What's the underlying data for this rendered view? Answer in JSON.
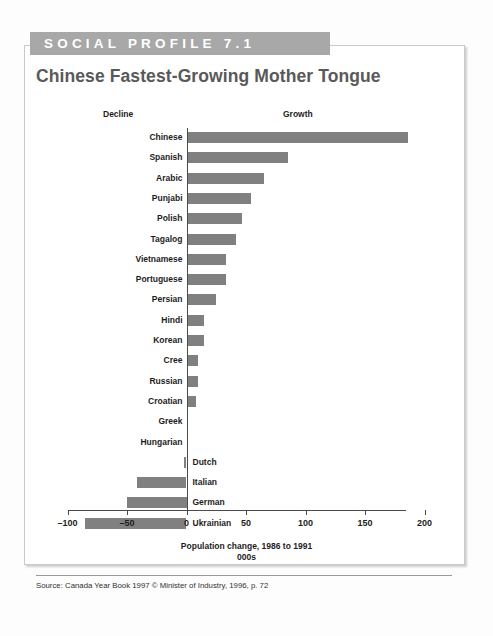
{
  "banner": {
    "label": "SOCIAL PROFILE 7.1"
  },
  "title": "Chinese Fastest-Growing Mother Tongue",
  "headers": {
    "decline": "Decline",
    "growth": "Growth"
  },
  "source": "Source: Canada Year Book 1997 © Minister of Industry, 1996, p. 72",
  "colors": {
    "banner_fill": "#a8a8a8",
    "bar_fill": "#808080",
    "title_text": "#595959",
    "axis": "#4a4a4a",
    "card_border": "#c9c9c9"
  },
  "chart_data": {
    "type": "bar",
    "orientation": "horizontal",
    "title": "Chinese Fastest-Growing Mother Tongue",
    "xlabel": "Population change, 1986 to 1991",
    "xlabel_line2": "000s",
    "ylabel": "",
    "xlim": [
      -100,
      200
    ],
    "ticks": [
      -100,
      -50,
      0,
      50,
      100,
      150,
      200
    ],
    "tick_labels": [
      "–100",
      "–50",
      "0",
      "50",
      "100",
      "150",
      "200"
    ],
    "grid": false,
    "legend": false,
    "annotations": [
      "Decline",
      "Growth"
    ],
    "units": "thousands",
    "categories": [
      "Chinese",
      "Spanish",
      "Arabic",
      "Punjabi",
      "Polish",
      "Tagalog",
      "Vietnamese",
      "Portuguese",
      "Persian",
      "Hindi",
      "Korean",
      "Cree",
      "Russian",
      "Croatian",
      "Greek",
      "Hungarian",
      "Dutch",
      "Italian",
      "German",
      "Ukrainian"
    ],
    "values": [
      186,
      85,
      65,
      54,
      47,
      42,
      33,
      33,
      25,
      15,
      15,
      10,
      10,
      8,
      0,
      0,
      -2,
      -42,
      -50,
      -85
    ]
  }
}
